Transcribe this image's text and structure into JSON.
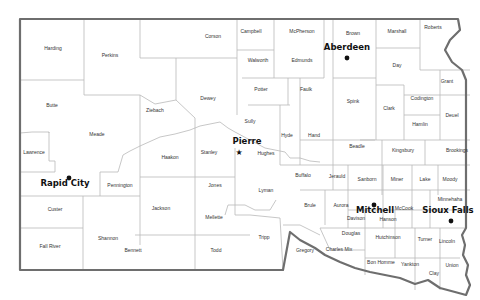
{
  "map": {
    "colors": {
      "border": "#6e6e6e",
      "county_line": "#b9b9b9",
      "label": "#333333",
      "city": "#111111",
      "background": "#ffffff"
    },
    "counties": [
      {
        "name": "Harding",
        "x": 53,
        "y": 50
      },
      {
        "name": "Perkins",
        "x": 110,
        "y": 57
      },
      {
        "name": "Corson",
        "x": 213,
        "y": 38
      },
      {
        "name": "Campbell",
        "x": 251,
        "y": 33
      },
      {
        "name": "McPherson",
        "x": 302,
        "y": 33
      },
      {
        "name": "Brown",
        "x": 353,
        "y": 35
      },
      {
        "name": "Marshall",
        "x": 397,
        "y": 33
      },
      {
        "name": "Roberts",
        "x": 433,
        "y": 29
      },
      {
        "name": "Walworth",
        "x": 258,
        "y": 62
      },
      {
        "name": "Edmunds",
        "x": 302,
        "y": 62
      },
      {
        "name": "Day",
        "x": 397,
        "y": 67
      },
      {
        "name": "Grant",
        "x": 447,
        "y": 83
      },
      {
        "name": "Potter",
        "x": 261,
        "y": 91
      },
      {
        "name": "Faulk",
        "x": 306,
        "y": 91
      },
      {
        "name": "Dewey",
        "x": 208,
        "y": 100
      },
      {
        "name": "Codington",
        "x": 422,
        "y": 100
      },
      {
        "name": "Butte",
        "x": 52,
        "y": 107
      },
      {
        "name": "Spink",
        "x": 353,
        "y": 103
      },
      {
        "name": "Clark",
        "x": 389,
        "y": 110
      },
      {
        "name": "Deuel",
        "x": 452,
        "y": 117
      },
      {
        "name": "Ziebach",
        "x": 155,
        "y": 112
      },
      {
        "name": "Sully",
        "x": 250,
        "y": 123
      },
      {
        "name": "Hamlin",
        "x": 420,
        "y": 126
      },
      {
        "name": "Meade",
        "x": 97,
        "y": 136
      },
      {
        "name": "Hyde",
        "x": 287,
        "y": 137
      },
      {
        "name": "Hand",
        "x": 314,
        "y": 137
      },
      {
        "name": "Beadle",
        "x": 357,
        "y": 148
      },
      {
        "name": "Kingsbury",
        "x": 403,
        "y": 152
      },
      {
        "name": "Brookings",
        "x": 457,
        "y": 152
      },
      {
        "name": "Haakon",
        "x": 170,
        "y": 159
      },
      {
        "name": "Stanley",
        "x": 209,
        "y": 154
      },
      {
        "name": "Hughes",
        "x": 266,
        "y": 155
      },
      {
        "name": "Lawrence",
        "x": 34,
        "y": 154
      },
      {
        "name": "Buffalo",
        "x": 303,
        "y": 177
      },
      {
        "name": "Jerauld",
        "x": 337,
        "y": 178
      },
      {
        "name": "Sanborn",
        "x": 367,
        "y": 181
      },
      {
        "name": "Miner",
        "x": 397,
        "y": 181
      },
      {
        "name": "Lake",
        "x": 425,
        "y": 181
      },
      {
        "name": "Moody",
        "x": 450,
        "y": 181
      },
      {
        "name": "Jones",
        "x": 215,
        "y": 187
      },
      {
        "name": "Pennington",
        "x": 120,
        "y": 187
      },
      {
        "name": "Lyman",
        "x": 266,
        "y": 192
      },
      {
        "name": "Minnehaha",
        "x": 450,
        "y": 201
      },
      {
        "name": "Brule",
        "x": 310,
        "y": 207
      },
      {
        "name": "Aurora",
        "x": 341,
        "y": 207
      },
      {
        "name": "McCook",
        "x": 404,
        "y": 210
      },
      {
        "name": "Custer",
        "x": 55,
        "y": 211
      },
      {
        "name": "Jackson",
        "x": 161,
        "y": 210
      },
      {
        "name": "Davison",
        "x": 356,
        "y": 220
      },
      {
        "name": "Hanson",
        "x": 388,
        "y": 221
      },
      {
        "name": "Mellette",
        "x": 214,
        "y": 219
      },
      {
        "name": "Shannon",
        "x": 108,
        "y": 240
      },
      {
        "name": "Tripp",
        "x": 264,
        "y": 239
      },
      {
        "name": "Douglas",
        "x": 351,
        "y": 235
      },
      {
        "name": "Hutchinson",
        "x": 388,
        "y": 239
      },
      {
        "name": "Turner",
        "x": 425,
        "y": 241
      },
      {
        "name": "Lincoln",
        "x": 447,
        "y": 243
      },
      {
        "name": "Charles Mix",
        "x": 339,
        "y": 251
      },
      {
        "name": "Fall River",
        "x": 50,
        "y": 248
      },
      {
        "name": "Bennett",
        "x": 133,
        "y": 252
      },
      {
        "name": "Todd",
        "x": 216,
        "y": 252
      },
      {
        "name": "Gregory",
        "x": 305,
        "y": 252
      },
      {
        "name": "Bon Homme",
        "x": 381,
        "y": 264
      },
      {
        "name": "Yankton",
        "x": 410,
        "y": 266
      },
      {
        "name": "Union",
        "x": 452,
        "y": 267
      },
      {
        "name": "Clay",
        "x": 434,
        "y": 275
      }
    ],
    "cities": [
      {
        "name": "Aberdeen",
        "x": 347,
        "y": 50,
        "dot_x": 347,
        "dot_y": 58,
        "type": "dot"
      },
      {
        "name": "Pierre",
        "x": 247,
        "y": 144,
        "dot_x": 239,
        "dot_y": 152,
        "type": "capital"
      },
      {
        "name": "Rapid City",
        "x": 65,
        "y": 186,
        "dot_x": 69,
        "dot_y": 178,
        "type": "dot"
      },
      {
        "name": "Mitchell",
        "x": 375,
        "y": 213,
        "dot_x": 374,
        "dot_y": 205,
        "type": "dot"
      },
      {
        "name": "Sioux Falls",
        "x": 448,
        "y": 213,
        "dot_x": 451,
        "dot_y": 221,
        "type": "dot"
      }
    ]
  }
}
